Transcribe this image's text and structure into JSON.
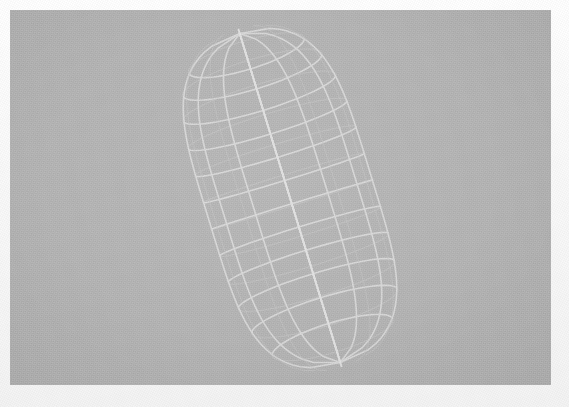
{
  "figure": {
    "kind": "3d-wireframe-render",
    "caption": "",
    "title": ""
  },
  "canvas": {
    "x": 10,
    "y": 10,
    "width": 541,
    "height": 375,
    "background_color": "#b4b4b4",
    "page_background_color": "#fdfdfd"
  },
  "render": {
    "surface_fill_color": "#8e8e8e",
    "wire_color": "#d8d8d8",
    "wire_color_dim": "#c6c6c6",
    "silhouette_color": "#e6e6e6",
    "wire_width": 1.6,
    "shading": "flat",
    "background_color": "#b4b4b4"
  },
  "geometry": {
    "shape": "capsule",
    "tilt_degrees": -17,
    "center_x": 290,
    "center_y": 198,
    "body_half_width": 84,
    "body_half_height": 172,
    "cap_roundness": 0.42,
    "meridian_count": 12,
    "latitude_count": 14,
    "visible_meridians_front": 6,
    "visible_latitudes_front": 7,
    "bounds": {
      "left": 188,
      "top": 28,
      "right": 398,
      "bottom": 368
    }
  },
  "chart_data": {
    "type": "scatter",
    "title": "",
    "xlabel": "",
    "ylabel": "",
    "note": "wireframe mesh of a tilted capsule; rings and meridians only",
    "rings_u": [
      0.0,
      0.07,
      0.13,
      0.2,
      0.28,
      0.36,
      0.44,
      0.52,
      0.6,
      0.68,
      0.76,
      0.84,
      0.92,
      1.0
    ],
    "meridians_v": [
      0,
      30,
      60,
      90,
      120,
      150,
      180,
      210,
      240,
      270,
      300,
      330
    ]
  }
}
